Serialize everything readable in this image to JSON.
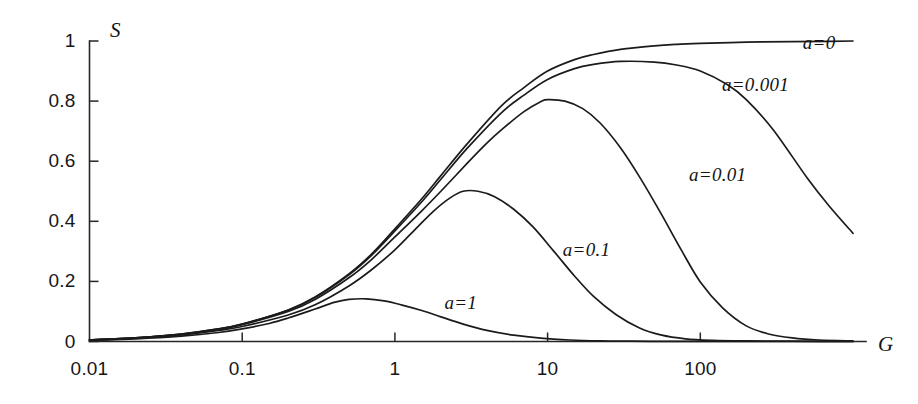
{
  "chart_data": {
    "type": "line",
    "title": "",
    "xlabel": "G",
    "ylabel": "S",
    "xscale": "log",
    "yscale": "linear",
    "xlim": [
      0.01,
      1000
    ],
    "ylim": [
      0,
      1
    ],
    "grid": false,
    "legend_position": "inline-annotations",
    "xticks": [
      "0.01",
      "0.1",
      "1",
      "10",
      "100"
    ],
    "xtick_values": [
      0.01,
      0.1,
      1,
      10,
      100
    ],
    "yticks": [
      "0",
      "0.2",
      "0.4",
      "0.6",
      "0.8",
      "1"
    ],
    "ytick_values": [
      0,
      0.2,
      0.4,
      0.6,
      0.8,
      1
    ],
    "series": [
      {
        "name": "a=0",
        "label": "a=0",
        "color": "#1b1b1b",
        "x": [
          0.01,
          0.02,
          0.04,
          0.07,
          0.1,
          0.2,
          0.3,
          0.5,
          0.7,
          1,
          1.5,
          2,
          3,
          5,
          7,
          10,
          15,
          20,
          30,
          50,
          70,
          100,
          200,
          400,
          700,
          1000
        ],
        "y": [
          0.005,
          0.012,
          0.025,
          0.042,
          0.058,
          0.105,
          0.148,
          0.225,
          0.29,
          0.375,
          0.475,
          0.552,
          0.66,
          0.785,
          0.845,
          0.9,
          0.938,
          0.955,
          0.972,
          0.984,
          0.989,
          0.992,
          0.996,
          0.998,
          0.999,
          1.0
        ]
      },
      {
        "name": "a=0.001",
        "label": "a=0.001",
        "color": "#1b1b1b",
        "x": [
          0.01,
          0.02,
          0.04,
          0.07,
          0.1,
          0.2,
          0.3,
          0.5,
          0.7,
          1,
          1.5,
          2,
          3,
          5,
          7,
          10,
          15,
          20,
          30,
          50,
          70,
          100,
          150,
          200,
          300,
          500,
          700,
          1000
        ],
        "y": [
          0.005,
          0.012,
          0.025,
          0.042,
          0.058,
          0.104,
          0.146,
          0.222,
          0.286,
          0.368,
          0.465,
          0.54,
          0.645,
          0.762,
          0.82,
          0.872,
          0.908,
          0.922,
          0.932,
          0.93,
          0.92,
          0.9,
          0.855,
          0.805,
          0.705,
          0.545,
          0.45,
          0.36
        ]
      },
      {
        "name": "a=0.01",
        "label": "a=0.01",
        "color": "#1b1b1b",
        "x": [
          0.01,
          0.02,
          0.04,
          0.07,
          0.1,
          0.2,
          0.3,
          0.5,
          0.7,
          1,
          1.5,
          2,
          3,
          4,
          5,
          7,
          9,
          10,
          13,
          17,
          22,
          30,
          40,
          55,
          75,
          100,
          140,
          200,
          280,
          400,
          600,
          1000
        ],
        "y": [
          0.005,
          0.012,
          0.024,
          0.04,
          0.056,
          0.1,
          0.14,
          0.212,
          0.272,
          0.348,
          0.435,
          0.5,
          0.595,
          0.66,
          0.705,
          0.765,
          0.798,
          0.805,
          0.8,
          0.775,
          0.728,
          0.645,
          0.548,
          0.428,
          0.305,
          0.198,
          0.112,
          0.052,
          0.025,
          0.012,
          0.005,
          0.002
        ]
      },
      {
        "name": "a=0.1",
        "label": "a=0.1",
        "color": "#1b1b1b",
        "x": [
          0.01,
          0.02,
          0.04,
          0.07,
          0.1,
          0.2,
          0.3,
          0.5,
          0.7,
          1,
          1.4,
          1.8,
          2.3,
          2.8,
          3.5,
          4.5,
          6,
          8,
          11,
          15,
          20,
          28,
          40,
          55,
          80,
          120,
          200,
          400,
          1000
        ],
        "y": [
          0.005,
          0.011,
          0.022,
          0.037,
          0.05,
          0.088,
          0.122,
          0.185,
          0.238,
          0.305,
          0.38,
          0.435,
          0.478,
          0.5,
          0.5,
          0.482,
          0.44,
          0.382,
          0.3,
          0.218,
          0.15,
          0.09,
          0.045,
          0.022,
          0.009,
          0.004,
          0.002,
          0.001,
          0.0
        ]
      },
      {
        "name": "a=1",
        "label": "a=1",
        "color": "#1b1b1b",
        "x": [
          0.01,
          0.02,
          0.04,
          0.07,
          0.1,
          0.15,
          0.2,
          0.3,
          0.4,
          0.5,
          0.65,
          0.85,
          1.1,
          1.5,
          2,
          2.8,
          4,
          6,
          9,
          14,
          22,
          35,
          60,
          100,
          200,
          500,
          1000
        ],
        "y": [
          0.004,
          0.009,
          0.018,
          0.03,
          0.042,
          0.06,
          0.078,
          0.108,
          0.13,
          0.14,
          0.142,
          0.135,
          0.122,
          0.103,
          0.082,
          0.058,
          0.037,
          0.021,
          0.011,
          0.005,
          0.002,
          0.001,
          0.0005,
          0.0002,
          0.0001,
          0.0,
          0.0
        ]
      }
    ],
    "annotations": [
      {
        "text": "a=0",
        "x": 600,
        "y": 0.995
      },
      {
        "text": "a=0.001",
        "x": 230,
        "y": 0.855
      },
      {
        "text": "a=0.01",
        "x": 130,
        "y": 0.555
      },
      {
        "text": "a=0.1",
        "x": 18,
        "y": 0.305
      },
      {
        "text": "a=1",
        "x": 2.7,
        "y": 0.127
      }
    ]
  },
  "axis": {
    "y_title": "S",
    "x_title": "G"
  }
}
